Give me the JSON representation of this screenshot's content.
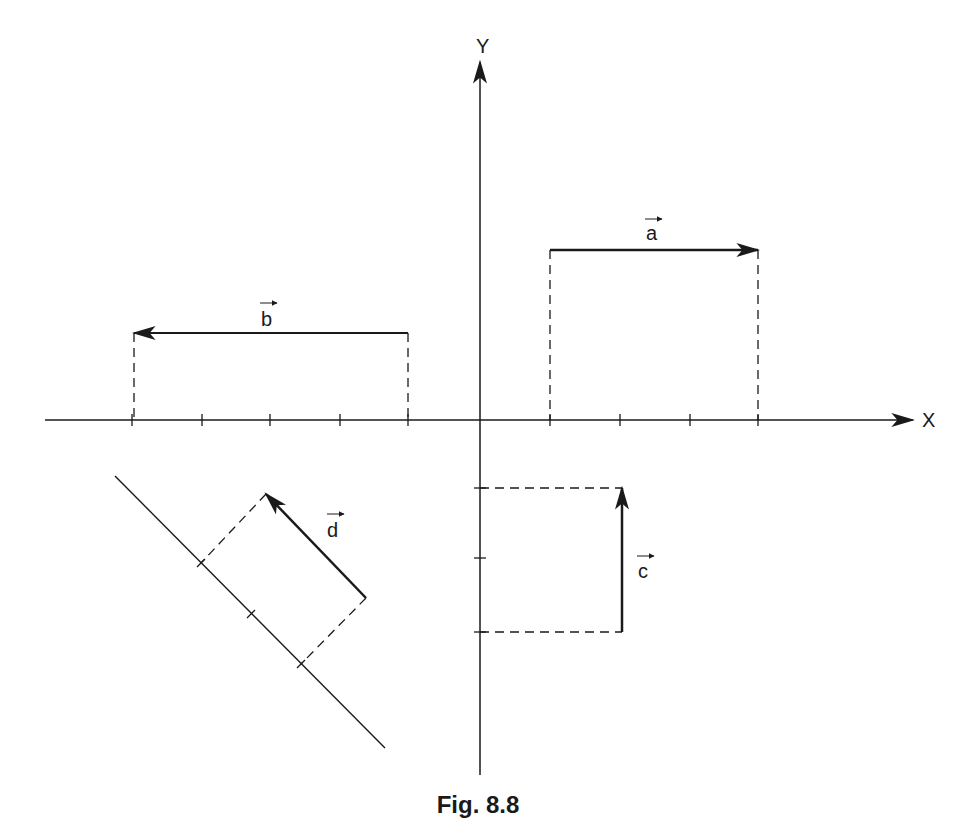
{
  "figure": {
    "caption": "Fig. 8.8",
    "axes": {
      "x_label": "X",
      "y_label": "Y",
      "origin": [
        480,
        420
      ]
    },
    "vectors": [
      {
        "name": "a",
        "label": "a",
        "from": [
          550,
          250
        ],
        "to": [
          758,
          250
        ],
        "direction": "right"
      },
      {
        "name": "b",
        "label": "b",
        "from": [
          408,
          333
        ],
        "to": [
          134,
          333
        ],
        "direction": "left"
      },
      {
        "name": "c",
        "label": "c",
        "from": [
          622,
          632
        ],
        "to": [
          622,
          488
        ],
        "direction": "up"
      },
      {
        "name": "d",
        "label": "d",
        "from": [
          366,
          598
        ],
        "to": [
          266,
          494
        ],
        "direction": "up-left"
      }
    ],
    "colors": {
      "ink": "#1a1a1a",
      "background": "#ffffff"
    }
  }
}
